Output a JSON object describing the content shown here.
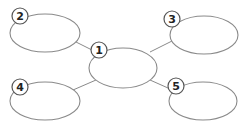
{
  "diagram": {
    "type": "spider-map",
    "nodes": [
      {
        "id": "1",
        "label": "1",
        "role": "center"
      },
      {
        "id": "2",
        "label": "2",
        "role": "top-left"
      },
      {
        "id": "3",
        "label": "3",
        "role": "top-right"
      },
      {
        "id": "4",
        "label": "4",
        "role": "bottom-left"
      },
      {
        "id": "5",
        "label": "5",
        "role": "bottom-right"
      }
    ],
    "edges": [
      [
        "1",
        "2"
      ],
      [
        "1",
        "3"
      ],
      [
        "1",
        "4"
      ],
      [
        "1",
        "5"
      ]
    ],
    "colors": {
      "stroke": "#8a8a8a",
      "badge_stroke": "#555555",
      "text": "#222222",
      "background": "#ffffff"
    }
  }
}
